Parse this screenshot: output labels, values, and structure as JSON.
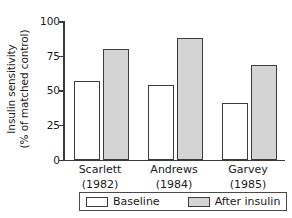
{
  "chart_data": {
    "type": "bar",
    "title": "",
    "xlabel": "",
    "ylabel_line1": "Insulin sensitivity",
    "ylabel_line2": "(% of matched control)",
    "ylim": [
      0,
      100
    ],
    "yticks": [
      0,
      25,
      50,
      75,
      100
    ],
    "ytick_labels": [
      "0",
      "25",
      "50",
      "75",
      "100"
    ],
    "grid": false,
    "legend_position": "bottom",
    "categories": [
      {
        "name": "Scarlett",
        "year": "(1982)"
      },
      {
        "name": "Andrews",
        "year": "(1984)"
      },
      {
        "name": "Garvey",
        "year": "(1985)"
      }
    ],
    "series": [
      {
        "name": "Baseline",
        "color": "#ffffff",
        "values": [
          57,
          54,
          41
        ]
      },
      {
        "name": "After insulin",
        "color": "#d4d4d4",
        "values": [
          80,
          88,
          68
        ]
      }
    ]
  },
  "legend": {
    "items": [
      {
        "label": "Baseline"
      },
      {
        "label": "After insulin"
      }
    ]
  }
}
